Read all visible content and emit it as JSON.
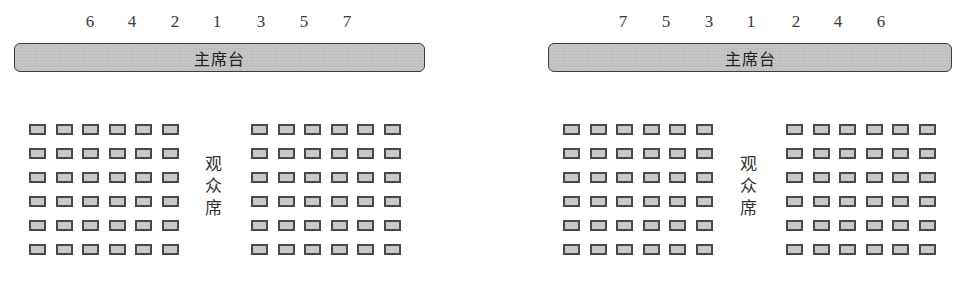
{
  "diagrams": [
    {
      "id": "left",
      "numbers": [
        "6",
        "4",
        "2",
        "1",
        "3",
        "5",
        "7"
      ],
      "stage_label": "主席台",
      "audience_label": [
        "观",
        "众",
        "席"
      ],
      "seat_blocks": [
        {
          "rows": 6,
          "cols": 6
        },
        {
          "rows": 6,
          "cols": 6
        }
      ]
    },
    {
      "id": "right",
      "numbers": [
        "7",
        "5",
        "3",
        "1",
        "2",
        "4",
        "6"
      ],
      "stage_label": "主席台",
      "audience_label": [
        "观",
        "众",
        "席"
      ],
      "seat_blocks": [
        {
          "rows": 6,
          "cols": 6
        },
        {
          "rows": 6,
          "cols": 6
        }
      ]
    }
  ],
  "colors": {
    "stage_fill": "#c4c4c4",
    "stage_border": "#3c3c3c",
    "seat_fill": "#c9c9c9",
    "seat_border": "#4a4a4a"
  }
}
